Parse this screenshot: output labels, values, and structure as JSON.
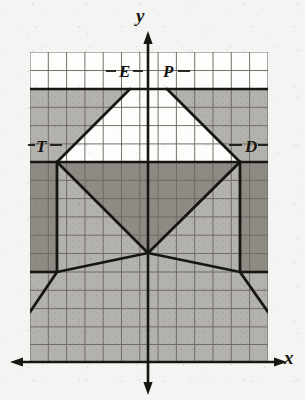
{
  "figure": {
    "type": "coordinate-grid-geometry-diagram",
    "axes": {
      "x_label": "x",
      "y_label": "y",
      "x_axis_y_pixel": 362,
      "y_axis_x_pixel": 148,
      "arrows": [
        "left",
        "right",
        "up",
        "down"
      ]
    },
    "grid": {
      "left": 30,
      "top": 52,
      "cell": 18.3,
      "cols": 13,
      "rows": 17,
      "line_color": "#6d6a63",
      "border_color": "#4a4843"
    },
    "points": [
      {
        "name": "E",
        "label": "E",
        "x": 130,
        "y": 89
      },
      {
        "name": "P",
        "label": "P",
        "x": 167,
        "y": 89
      },
      {
        "name": "T",
        "label": "T",
        "x": 57,
        "y": 162
      },
      {
        "name": "D",
        "label": "D",
        "x": 240,
        "y": 162
      }
    ],
    "center": {
      "x": 148,
      "y": 253
    },
    "colors": {
      "paper": "#f4f4f2",
      "white_cells": "#fdfdfc",
      "light_shade": "#b4b2ad",
      "dark_shade": "#8e8b85",
      "stroke": "#181612",
      "grid_line": "#6d6a63"
    },
    "shaded_regions": [
      {
        "name": "upper-band",
        "tone": "light",
        "from_y": 89,
        "to_y": 162
      },
      {
        "name": "left-dark-column",
        "tone": "dark",
        "from_y": 162,
        "to_y": 272
      },
      {
        "name": "right-dark-column",
        "tone": "dark",
        "from_y": 162,
        "to_y": 272
      },
      {
        "name": "central-dark-triangle",
        "tone": "dark",
        "vertices": "T-D-center"
      },
      {
        "name": "lower-band",
        "tone": "light",
        "from_y": 272,
        "to_y": 362
      }
    ],
    "segments": [
      {
        "from": "T",
        "to": "E"
      },
      {
        "from": "P",
        "to": "D"
      },
      {
        "from": "E",
        "to": "P",
        "note": "along top shade boundary"
      },
      {
        "from": "T",
        "to": "D",
        "note": "along horizontal boundary"
      },
      {
        "from": "T",
        "to": "center"
      },
      {
        "from": "D",
        "to": "center"
      },
      {
        "from": "center",
        "to": "lower-left-extension"
      },
      {
        "from": "center",
        "to": "lower-right-extension"
      },
      {
        "from": "T",
        "to": "below-left"
      },
      {
        "from": "D",
        "to": "below-right"
      }
    ]
  }
}
